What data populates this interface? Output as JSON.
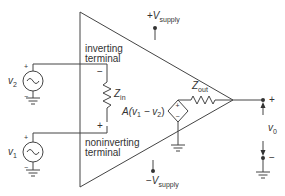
{
  "diagram": {
    "colors": {
      "stroke": "#444444",
      "text": "#333333",
      "background": "#ffffff"
    },
    "supply_positive": {
      "prefix": "+",
      "symbol": "V",
      "subscript": "supply"
    },
    "supply_negative": {
      "prefix": "−",
      "symbol": "V",
      "subscript": "supply"
    },
    "inverting_label": {
      "line1": "inverting",
      "line2": "terminal",
      "polarity": "−"
    },
    "noninverting_label": {
      "line1": "noninverting",
      "line2": "terminal",
      "polarity": "+"
    },
    "source_v2": {
      "symbol": "v",
      "subscript": "2",
      "plus": "+",
      "minus": "−",
      "glyph": "~"
    },
    "source_v1": {
      "symbol": "v",
      "subscript": "1",
      "plus": "+",
      "minus": "−",
      "glyph": "~"
    },
    "input_impedance": {
      "symbol": "Z",
      "subscript": "in"
    },
    "output_impedance": {
      "symbol": "Z",
      "subscript": "out"
    },
    "dependent_source": {
      "expression_prefix": "A(v",
      "sub1": "1",
      "middle": " − v",
      "sub2": "2",
      "suffix": ")",
      "plus": "+",
      "minus": "−"
    },
    "output": {
      "symbol": "v",
      "subscript": "0",
      "plus": "+",
      "minus": "−"
    }
  }
}
